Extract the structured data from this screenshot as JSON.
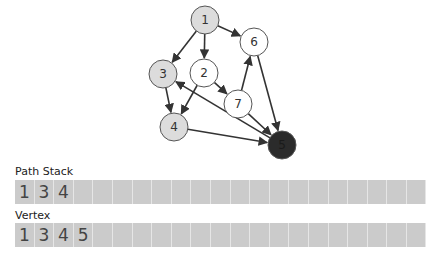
{
  "graph": {
    "nodes": [
      {
        "id": "1",
        "x": 205,
        "y": 20,
        "state": "visited"
      },
      {
        "id": "6",
        "x": 254,
        "y": 42,
        "state": "unvisited"
      },
      {
        "id": "3",
        "x": 163,
        "y": 74,
        "state": "visited"
      },
      {
        "id": "2",
        "x": 204,
        "y": 73,
        "state": "unvisited"
      },
      {
        "id": "7",
        "x": 238,
        "y": 104,
        "state": "unvisited"
      },
      {
        "id": "4",
        "x": 174,
        "y": 127,
        "state": "visited"
      },
      {
        "id": "5",
        "x": 282,
        "y": 145,
        "state": "current"
      }
    ],
    "edges": [
      [
        "1",
        "3"
      ],
      [
        "1",
        "2"
      ],
      [
        "1",
        "6"
      ],
      [
        "3",
        "4"
      ],
      [
        "2",
        "4"
      ],
      [
        "2",
        "7"
      ],
      [
        "7",
        "6"
      ],
      [
        "7",
        "5"
      ],
      [
        "6",
        "5"
      ],
      [
        "4",
        "5"
      ],
      [
        "5",
        "3"
      ]
    ],
    "colors": {
      "visited": "#dcdcdc",
      "unvisited": "#ffffff",
      "current": "#2b2b2b",
      "stroke": "#555555",
      "edge": "#333333"
    }
  },
  "path_stack": {
    "label": "Path Stack",
    "values": [
      "1",
      "3",
      "4",
      "",
      "",
      "",
      "",
      "",
      "",
      "",
      "",
      "",
      "",
      "",
      "",
      "",
      "",
      "",
      "",
      "",
      ""
    ]
  },
  "vertex": {
    "label": "Vertex",
    "values": [
      "1",
      "3",
      "4",
      "5",
      "",
      "",
      "",
      "",
      "",
      "",
      "",
      "",
      "",
      "",
      "",
      "",
      "",
      "",
      "",
      "",
      ""
    ]
  }
}
